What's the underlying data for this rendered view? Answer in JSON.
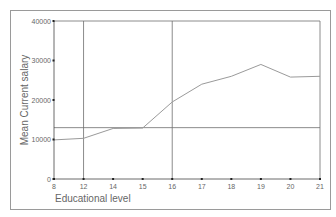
{
  "chart_data": {
    "type": "line",
    "title": "",
    "xlabel": "Educational level",
    "ylabel": "Mean Current salary",
    "categories": [
      "8",
      "12",
      "14",
      "15",
      "16",
      "17",
      "18",
      "19",
      "20",
      "21"
    ],
    "series": [
      {
        "name": "Mean Current salary",
        "values": [
          9900,
          10300,
          12800,
          12900,
          19500,
          24000,
          26000,
          29000,
          25800,
          26000
        ]
      }
    ],
    "ylim": [
      0,
      40000
    ],
    "yticks": [
      "0",
      "10000",
      "20000",
      "30000",
      "40000"
    ],
    "reference_lines": {
      "horizontal": [
        13000
      ],
      "vertical_categories": [
        "12",
        "16"
      ]
    },
    "grid": false,
    "legend": "none"
  },
  "colors": {
    "line": "#9a9a9a",
    "reference": "#6f6f6f",
    "axis": "#444444",
    "frame": "#9a9a9a"
  }
}
